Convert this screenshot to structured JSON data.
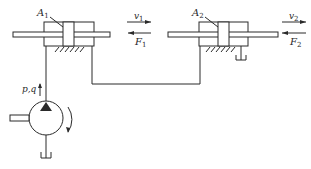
{
  "diagram": {
    "type": "hydraulic-circuit",
    "colors": {
      "stroke": "#2a2a2a",
      "background": "#ffffff"
    },
    "cylinder1": {
      "area_label": "A",
      "area_sub": "1",
      "velocity_label": "v",
      "velocity_sub": "1",
      "force_label": "F",
      "force_sub": "1"
    },
    "cylinder2": {
      "area_label": "A",
      "area_sub": "2",
      "velocity_label": "v",
      "velocity_sub": "2",
      "force_label": "F",
      "force_sub": "2"
    },
    "pump": {
      "output_label": "p,q"
    }
  }
}
